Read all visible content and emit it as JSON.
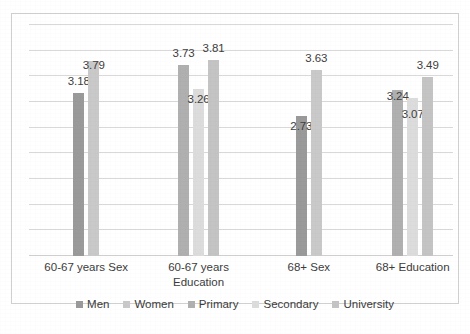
{
  "chart_data": {
    "type": "bar",
    "title": "",
    "subtitle": "",
    "xlabel": "",
    "ylabel": "",
    "ylim": [
      0,
      4.5
    ],
    "grid": true,
    "gridline_step": 0.5,
    "legend_position": "bottom",
    "categories": [
      "60-67 years Sex",
      "60-67 years Education",
      "68+ Sex",
      "68+ Education"
    ],
    "series": [
      {
        "name": "Men",
        "color": "#9a9a9a",
        "values": [
          3.18,
          null,
          2.73,
          null
        ]
      },
      {
        "name": "Women",
        "color": "#c9c9c9",
        "values": [
          3.79,
          null,
          3.63,
          null
        ]
      },
      {
        "name": "Primary",
        "color": "#b0b0b0",
        "values": [
          null,
          3.73,
          null,
          3.24
        ]
      },
      {
        "name": "Secondary",
        "color": "#dcdcdc",
        "values": [
          null,
          3.26,
          null,
          3.07
        ]
      },
      {
        "name": "University",
        "color": "#c4c4c4",
        "values": [
          null,
          3.81,
          null,
          3.49
        ]
      }
    ],
    "groups": [
      {
        "label_line1": "60-67 years Sex",
        "label_line2": "",
        "bars": [
          {
            "series": "Men",
            "value": 3.18,
            "label": "3.18",
            "color": "#9a9a9a"
          },
          {
            "series": "Women",
            "value": 3.79,
            "label": "3.79",
            "color": "#c9c9c9"
          }
        ]
      },
      {
        "label_line1": "60-67 years",
        "label_line2": "Education",
        "bars": [
          {
            "series": "Primary",
            "value": 3.73,
            "label": "3.73",
            "color": "#b0b0b0"
          },
          {
            "series": "Secondary",
            "value": 3.26,
            "label": "3.26",
            "color": "#dcdcdc"
          },
          {
            "series": "University",
            "value": 3.81,
            "label": "3.81",
            "color": "#c4c4c4"
          }
        ]
      },
      {
        "label_line1": "68+ Sex",
        "label_line2": "",
        "bars": [
          {
            "series": "Men",
            "value": 2.73,
            "label": "2.73",
            "color": "#9a9a9a"
          },
          {
            "series": "Women",
            "value": 3.63,
            "label": "3.63",
            "color": "#c9c9c9"
          }
        ]
      },
      {
        "label_line1": "68+ Education",
        "label_line2": "",
        "bars": [
          {
            "series": "Primary",
            "value": 3.24,
            "label": "3.24",
            "color": "#b0b0b0"
          },
          {
            "series": "Secondary",
            "value": 3.07,
            "label": "3.07",
            "color": "#dcdcdc"
          },
          {
            "series": "University",
            "value": 3.49,
            "label": "3.49",
            "color": "#c4c4c4"
          }
        ]
      }
    ],
    "legend": [
      {
        "label": "Men",
        "color": "#9a9a9a"
      },
      {
        "label": "Women",
        "color": "#c9c9c9"
      },
      {
        "label": "Primary",
        "color": "#b0b0b0"
      },
      {
        "label": "Secondary",
        "color": "#dcdcdc"
      },
      {
        "label": "University",
        "color": "#c4c4c4"
      }
    ]
  },
  "layout": {
    "group_centers_pct": [
      13.5,
      40.0,
      66.0,
      90.5
    ],
    "label_value_offsets": [
      [
        -16,
        0
      ],
      [
        -16,
        6,
        -16
      ],
      [
        6,
        -16
      ],
      [
        2,
        12,
        -16
      ]
    ]
  }
}
